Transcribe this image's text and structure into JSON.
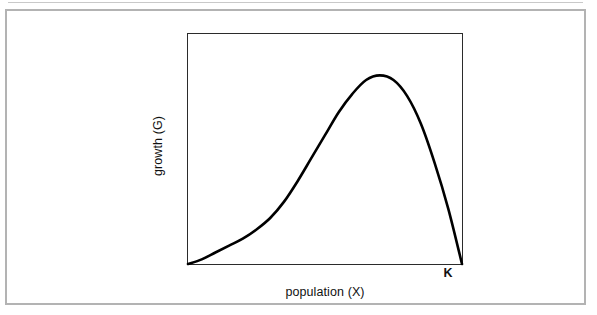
{
  "figure": {
    "background_color": "#ffffff",
    "frame_color": "#b3b3b3",
    "axes_color": "#2b2b2b",
    "curve_color": "#000000"
  },
  "labels": {
    "y_axis": "growth (G)",
    "x_axis": "population (X)",
    "carrying_capacity": "K"
  },
  "chart_data": {
    "type": "line",
    "title": "",
    "subtitle": "",
    "xlabel": "population (X)",
    "ylabel": "growth (G)",
    "grid": false,
    "legend": null,
    "xlim": [
      0,
      1.0
    ],
    "ylim": [
      0,
      1.0
    ],
    "xtick_labels": [
      "K"
    ],
    "xtick_values": [
      1.0
    ],
    "ytick_labels": [],
    "annotations": [
      {
        "text": "K",
        "x": 1.0,
        "y": 0,
        "note": "carrying capacity; growth returns to zero"
      }
    ],
    "series": [
      {
        "name": "growth rate",
        "x": [
          0.0,
          0.05,
          0.1,
          0.15,
          0.2,
          0.25,
          0.3,
          0.35,
          0.4,
          0.45,
          0.5,
          0.55,
          0.6,
          0.65,
          0.7,
          0.75,
          0.8,
          0.85,
          0.9,
          0.95,
          1.0
        ],
        "y": [
          0.0,
          0.02,
          0.05,
          0.08,
          0.11,
          0.15,
          0.2,
          0.27,
          0.36,
          0.46,
          0.56,
          0.66,
          0.74,
          0.8,
          0.82,
          0.8,
          0.73,
          0.61,
          0.44,
          0.24,
          0.0
        ]
      }
    ],
    "peak": {
      "x": 0.7,
      "y": 0.82
    }
  }
}
